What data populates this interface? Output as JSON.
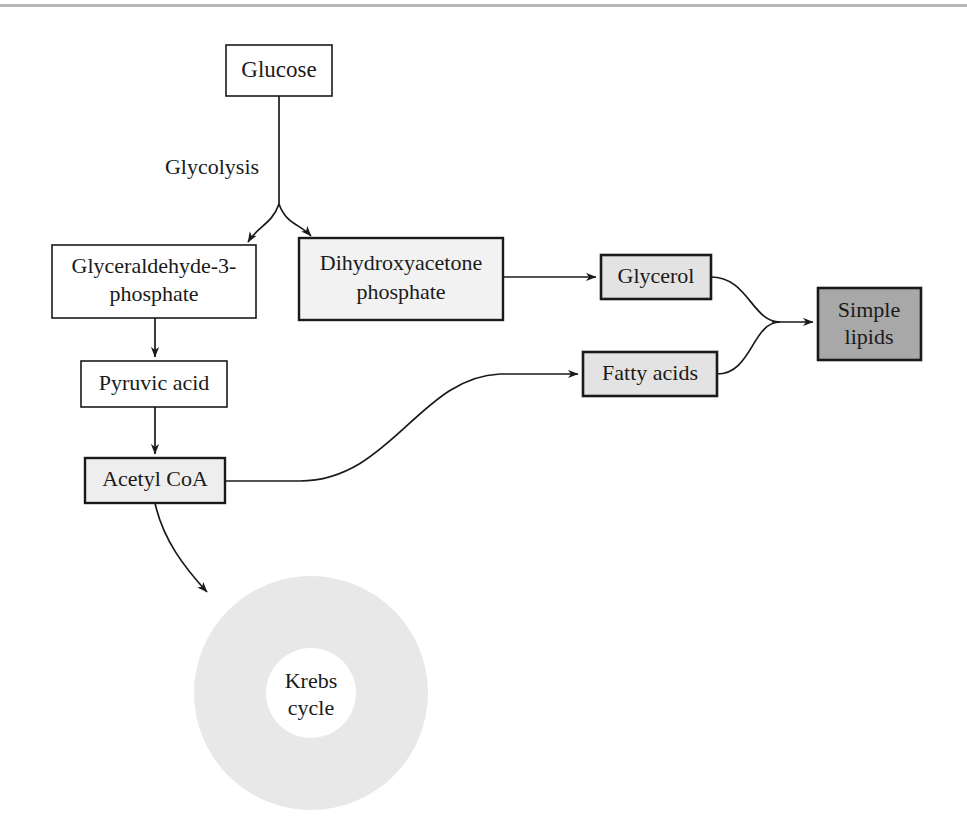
{
  "diagram": {
    "colors": {
      "white_fill": "#ffffff",
      "light_gray_fill": "#e9e9e9",
      "pale_gray_fill": "#f2f2f2",
      "medium_gray_fill": "#a8a8a8",
      "krebs_ring_fill": "#e8e8e8",
      "stroke": "#1a1a1a",
      "page_line": "#b7b7b7"
    },
    "nodes": [
      {
        "id": "glucose",
        "label": "Glucose",
        "lines": [
          "Glucose"
        ],
        "shape": "rect",
        "fill": "#ffffff",
        "stroke_width": 1.6,
        "font_size": 23,
        "x": 226,
        "y": 45,
        "w": 106,
        "h": 51
      },
      {
        "id": "glyceraldehyde-3-phosphate",
        "label": "Glyceraldehyde-3-phosphate",
        "lines": [
          "Glyceraldehyde-3-",
          "phosphate"
        ],
        "shape": "rect",
        "fill": "#ffffff",
        "stroke_width": 1.6,
        "font_size": 22,
        "x": 52,
        "y": 245,
        "w": 204,
        "h": 73
      },
      {
        "id": "dihydroxyacetone-phosphate",
        "label": "Dihydroxyacetone phosphate",
        "lines": [
          "Dihydroxyacetone",
          "phosphate"
        ],
        "shape": "rect",
        "fill": "#f2f2f2",
        "stroke_width": 2.4,
        "font_size": 22,
        "x": 299,
        "y": 238,
        "w": 204,
        "h": 82
      },
      {
        "id": "pyruvic-acid",
        "label": "Pyruvic acid",
        "lines": [
          "Pyruvic acid"
        ],
        "shape": "rect",
        "fill": "#ffffff",
        "stroke_width": 1.6,
        "font_size": 22,
        "x": 81,
        "y": 361,
        "w": 146,
        "h": 46
      },
      {
        "id": "acetyl-coa",
        "label": "Acetyl CoA",
        "lines": [
          "Acetyl CoA"
        ],
        "shape": "rect",
        "fill": "#eeeeee",
        "stroke_width": 2.4,
        "font_size": 22,
        "x": 85,
        "y": 458,
        "w": 140,
        "h": 45
      },
      {
        "id": "glycerol",
        "label": "Glycerol",
        "lines": [
          "Glycerol"
        ],
        "shape": "rect",
        "fill": "#e3e3e3",
        "stroke_width": 2.6,
        "font_size": 22,
        "x": 601,
        "y": 255,
        "w": 110,
        "h": 44
      },
      {
        "id": "fatty-acids",
        "label": "Fatty acids",
        "lines": [
          "Fatty acids"
        ],
        "shape": "rect",
        "fill": "#e3e3e3",
        "stroke_width": 2.6,
        "font_size": 22,
        "x": 583,
        "y": 352,
        "w": 134,
        "h": 44
      },
      {
        "id": "simple-lipids",
        "label": "Simple lipids",
        "lines": [
          "Simple",
          "lipids"
        ],
        "shape": "rect",
        "fill": "#a8a8a8",
        "stroke_width": 2.6,
        "font_size": 22,
        "x": 818,
        "y": 288,
        "w": 103,
        "h": 72
      },
      {
        "id": "krebs-cycle",
        "label": "Krebs cycle",
        "lines": [
          "Krebs",
          "cycle"
        ],
        "shape": "donut",
        "fill": "#e8e8e8",
        "font_size": 22,
        "cx": 311,
        "cy": 693,
        "r_outer": 117,
        "r_inner": 45
      }
    ],
    "edges": [
      {
        "id": "glucose-to-fork",
        "from": "glucose",
        "to": "fork",
        "label": "",
        "arrow": false
      },
      {
        "id": "fork-to-glyceraldehyde",
        "from": "fork",
        "to": "glyceraldehyde-3-phosphate",
        "label": "",
        "arrow": true
      },
      {
        "id": "fork-to-dihydroxyacetone",
        "from": "fork",
        "to": "dihydroxyacetone-phosphate",
        "label": "",
        "arrow": true
      },
      {
        "id": "glyceraldehyde-to-pyruvic",
        "from": "glyceraldehyde-3-phosphate",
        "to": "pyruvic-acid",
        "label": "",
        "arrow": true
      },
      {
        "id": "pyruvic-to-acetyl",
        "from": "pyruvic-acid",
        "to": "acetyl-coa",
        "label": "",
        "arrow": true
      },
      {
        "id": "acetyl-to-krebs",
        "from": "acetyl-coa",
        "to": "krebs-cycle",
        "label": "",
        "arrow": true
      },
      {
        "id": "acetyl-to-fatty-acids",
        "from": "acetyl-coa",
        "to": "fatty-acids",
        "label": "",
        "arrow": true
      },
      {
        "id": "dihydroxyacetone-to-glycerol",
        "from": "dihydroxyacetone-phosphate",
        "to": "glycerol",
        "label": "",
        "arrow": true
      },
      {
        "id": "glycerol-to-simple-lipids",
        "from": "glycerol",
        "to": "simple-lipids",
        "label": "",
        "arrow": true
      },
      {
        "id": "fatty-acids-to-simple-lipids",
        "from": "fatty-acids",
        "to": "simple-lipids",
        "label": "",
        "arrow": true
      }
    ],
    "edge_labels": [
      {
        "id": "glycolysis-label",
        "text": "Glycolysis",
        "x": 212,
        "y": 174,
        "font_size": 22
      }
    ]
  }
}
